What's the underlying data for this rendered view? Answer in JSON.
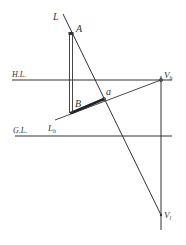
{
  "diagram": {
    "labels": {
      "line_L": "L",
      "point_A": "A",
      "point_B": "B",
      "point_a": "a",
      "horizon_line": "H.L.",
      "ground_line": "G.L.",
      "line_Lh": "L",
      "line_Lh_sub": "h",
      "vp_h": "V",
      "vp_h_sub": "h",
      "vp_l": "V",
      "vp_l_sub": "l"
    },
    "colors": {
      "line": "#333333",
      "background": "#ffffff"
    }
  }
}
